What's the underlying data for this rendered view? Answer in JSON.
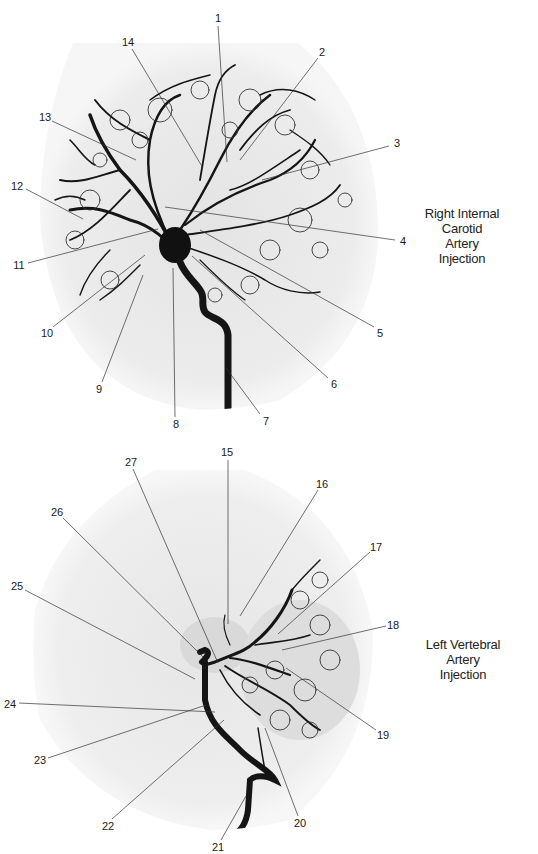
{
  "figure": {
    "panels": [
      {
        "id": "top",
        "caption_lines": [
          "Right Internal Carotid",
          "Artery Injection"
        ],
        "labels": [
          {
            "n": "1",
            "x": 218,
            "y": 18,
            "tx": 227,
            "ty": 162
          },
          {
            "n": "2",
            "x": 322,
            "y": 52,
            "tx": 240,
            "ty": 160
          },
          {
            "n": "3",
            "x": 397,
            "y": 143,
            "tx": 262,
            "ty": 180
          },
          {
            "n": "4",
            "x": 403,
            "y": 241,
            "tx": 165,
            "ty": 207
          },
          {
            "n": "5",
            "x": 380,
            "y": 333,
            "tx": 200,
            "ty": 230
          },
          {
            "n": "6",
            "x": 334,
            "y": 384,
            "tx": 192,
            "ty": 256
          },
          {
            "n": "7",
            "x": 266,
            "y": 421,
            "tx": 226,
            "ty": 368
          },
          {
            "n": "8",
            "x": 176,
            "y": 424,
            "tx": 173,
            "ty": 268
          },
          {
            "n": "9",
            "x": 99,
            "y": 389,
            "tx": 143,
            "ty": 275
          },
          {
            "n": "10",
            "x": 47,
            "y": 333,
            "tx": 145,
            "ty": 255
          },
          {
            "n": "11",
            "x": 19,
            "y": 265,
            "tx": 158,
            "ty": 229
          },
          {
            "n": "12",
            "x": 17,
            "y": 186,
            "tx": 83,
            "ty": 219
          },
          {
            "n": "13",
            "x": 45,
            "y": 117,
            "tx": 136,
            "ty": 160
          },
          {
            "n": "14",
            "x": 128,
            "y": 42,
            "tx": 203,
            "ty": 168
          }
        ]
      },
      {
        "id": "bottom",
        "caption_lines": [
          "Left Vertebral Artery",
          "Injection"
        ],
        "labels": [
          {
            "n": "15",
            "x": 227,
            "y": 22,
            "tx": 228,
            "ty": 194
          },
          {
            "n": "16",
            "x": 322,
            "y": 54,
            "tx": 240,
            "ty": 186
          },
          {
            "n": "17",
            "x": 376,
            "y": 117,
            "tx": 278,
            "ty": 204
          },
          {
            "n": "18",
            "x": 393,
            "y": 195,
            "tx": 282,
            "ty": 220
          },
          {
            "n": "19",
            "x": 383,
            "y": 305,
            "tx": 286,
            "ty": 238
          },
          {
            "n": "20",
            "x": 300,
            "y": 393,
            "tx": 265,
            "ty": 298
          },
          {
            "n": "21",
            "x": 218,
            "y": 417,
            "tx": 246,
            "ty": 366
          },
          {
            "n": "22",
            "x": 108,
            "y": 396,
            "tx": 224,
            "ty": 290
          },
          {
            "n": "23",
            "x": 40,
            "y": 330,
            "tx": 206,
            "ty": 275
          },
          {
            "n": "24",
            "x": 10,
            "y": 274,
            "tx": 215,
            "ty": 282
          },
          {
            "n": "25",
            "x": 17,
            "y": 156,
            "tx": 195,
            "ty": 249
          },
          {
            "n": "26",
            "x": 57,
            "y": 82,
            "tx": 203,
            "ty": 227
          },
          {
            "n": "27",
            "x": 131,
            "y": 32,
            "tx": 218,
            "ty": 233
          }
        ]
      }
    ]
  },
  "colors": {
    "background": "#ffffff",
    "film": "#ececec",
    "vessel": "#0d0d0d",
    "leader": "#333333"
  }
}
